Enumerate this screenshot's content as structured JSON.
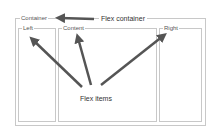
{
  "diagram": {
    "container": {
      "label": "Container"
    },
    "items": [
      {
        "label": "Left"
      },
      {
        "label": "Content"
      },
      {
        "label": "Right"
      }
    ],
    "annotations": {
      "container_note": "Flex container",
      "items_note": "Flex items"
    },
    "colors": {
      "border": "#c8c8c8",
      "arrow": "#555555"
    }
  }
}
